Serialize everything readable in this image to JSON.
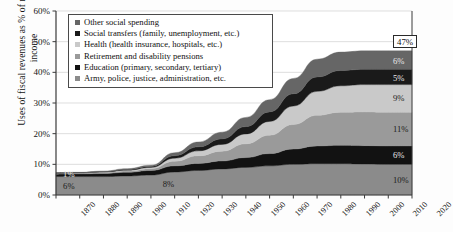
{
  "chart_data": {
    "type": "area",
    "title": "",
    "xlabel": "",
    "ylabel": "Uses of fiscal revenues as % of national income",
    "xlim": [
      1870,
      2020
    ],
    "ylim": [
      0,
      60
    ],
    "ytick_labels": [
      "0%",
      "10%",
      "20%",
      "30%",
      "40%",
      "50%",
      "60%"
    ],
    "ytick_values": [
      0,
      10,
      20,
      30,
      40,
      50,
      60
    ],
    "xtick_labels": [
      "1870",
      "1880",
      "1890",
      "1900",
      "1910",
      "1920",
      "1930",
      "1940",
      "1950",
      "1960",
      "1970",
      "1980",
      "1990",
      "2000",
      "2010",
      "2020"
    ],
    "grid": true,
    "stacked": true,
    "legend_position": "top-left",
    "x": [
      1870,
      1880,
      1890,
      1900,
      1910,
      1920,
      1930,
      1940,
      1950,
      1960,
      1970,
      1980,
      1990,
      2000,
      2010,
      2020
    ],
    "series": [
      {
        "name": "Army, police, justice, administration, etc.",
        "color": "#8b8b8b",
        "values": [
          6.0,
          6.0,
          6.0,
          6.2,
          6.5,
          7.5,
          8.0,
          8.5,
          9.0,
          9.5,
          10.0,
          10.2,
          10.2,
          10.1,
          10.0,
          10.0
        ]
      },
      {
        "name": "Education (primary, secondary, tertiary)",
        "color": "#121212",
        "values": [
          0.8,
          0.9,
          1.0,
          1.2,
          1.5,
          2.0,
          2.3,
          2.6,
          3.2,
          4.0,
          5.0,
          5.8,
          6.0,
          6.0,
          6.0,
          6.0
        ]
      },
      {
        "name": "Retirement and disability pensions",
        "color": "#9a9a9a",
        "values": [
          0.2,
          0.2,
          0.3,
          0.4,
          0.6,
          1.5,
          2.5,
          3.2,
          4.5,
          6.0,
          8.0,
          10.0,
          10.8,
          11.0,
          11.0,
          11.0
        ]
      },
      {
        "name": "Health (health insurance, hospitals, etc.)",
        "color": "#c9c9c9",
        "values": [
          0.1,
          0.1,
          0.2,
          0.3,
          0.4,
          1.0,
          1.6,
          2.2,
          3.2,
          4.5,
          6.0,
          7.8,
          8.6,
          8.9,
          9.0,
          9.0
        ]
      },
      {
        "name": "Social transfers (family, unemployment, etc.)",
        "color": "#1a1a1a",
        "values": [
          0.1,
          0.1,
          0.1,
          0.2,
          0.3,
          0.8,
          1.3,
          1.8,
          2.4,
          3.1,
          4.0,
          4.7,
          5.0,
          5.0,
          5.0,
          5.0
        ]
      },
      {
        "name": "Other social spending",
        "color": "#666666",
        "values": [
          0.1,
          0.1,
          0.2,
          0.3,
          0.4,
          1.0,
          1.6,
          2.2,
          3.0,
          4.0,
          5.0,
          5.8,
          6.0,
          6.0,
          6.0,
          6.0
        ]
      }
    ],
    "annotations": [
      {
        "text": "6%",
        "x": 1873,
        "y": 3.0,
        "style": "plain"
      },
      {
        "text": "1%",
        "x": 1873,
        "y": 7.0,
        "style": "plain"
      },
      {
        "text": "8%",
        "x": 1915,
        "y": 3.5,
        "style": "plain"
      },
      {
        "text": "47%",
        "x": 2012,
        "y": 50.5,
        "style": "boxed"
      },
      {
        "text": "6%",
        "x": 2012,
        "y": 43.8,
        "style": "plain"
      },
      {
        "text": "5%",
        "x": 2012,
        "y": 38.3,
        "style": "plain"
      },
      {
        "text": "9%",
        "x": 2012,
        "y": 31.5,
        "style": "plain"
      },
      {
        "text": "11%",
        "x": 2012,
        "y": 21.5,
        "style": "plain"
      },
      {
        "text": "6%",
        "x": 2012,
        "y": 13.0,
        "style": "plain"
      },
      {
        "text": "10%",
        "x": 2012,
        "y": 4.8,
        "style": "plain"
      }
    ],
    "legend_entries": [
      {
        "label": "Other social spending",
        "color": "#666666"
      },
      {
        "label": "Social transfers (family, unemployment, etc.)",
        "color": "#1a1a1a"
      },
      {
        "label": "Health (health insurance, hospitals, etc.)",
        "color": "#c9c9c9"
      },
      {
        "label": "Retirement and disability pensions",
        "color": "#9a9a9a"
      },
      {
        "label": "Education (primary, secondary, tertiary)",
        "color": "#121212"
      },
      {
        "label": "Army, police, justice, administration, etc.",
        "color": "#8b8b8b"
      }
    ]
  }
}
